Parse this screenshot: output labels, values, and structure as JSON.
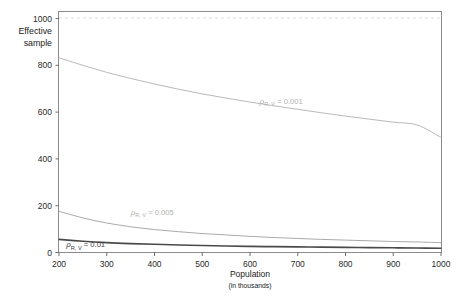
{
  "chart_data": {
    "type": "line",
    "title": "",
    "xlabel": "Population",
    "xlabel_sub": "(in thousands)",
    "ylabel_line1": "Effective",
    "ylabel_line2": "sample",
    "xlim": [
      200,
      1000
    ],
    "ylim": [
      0,
      1030
    ],
    "xticks": [
      200,
      300,
      400,
      500,
      600,
      700,
      800,
      900,
      1000
    ],
    "yticks": [
      0,
      200,
      400,
      600,
      800,
      1000
    ],
    "grid": false,
    "legend_position": "inline-annotations",
    "reference_line": {
      "label": "1000",
      "value": 1000,
      "style": "dashed",
      "color": "#d8d8d8"
    },
    "x": [
      200,
      250,
      300,
      350,
      400,
      450,
      500,
      550,
      600,
      650,
      700,
      750,
      800,
      850,
      900,
      950,
      1000
    ],
    "series": [
      {
        "name": "rho_RV_0001",
        "label_rho": "ρ",
        "label_sub": "R, V",
        "label_eq": " = 0.001",
        "color": "#b9b9b9",
        "width": 1.0,
        "values": [
          832,
          800,
          770,
          744,
          720,
          698,
          678,
          660,
          643,
          627,
          612,
          597,
          583,
          570,
          557,
          545,
          492
        ]
      },
      {
        "name": "rho_RV_0005",
        "label_rho": "ρ",
        "label_sub": "R, V",
        "label_eq": " = 0.005",
        "color": "#aaaaaa",
        "width": 1.0,
        "values": [
          176,
          148,
          126,
          110,
          98,
          89,
          81,
          75,
          69,
          64,
          60,
          56,
          53,
          50,
          47,
          45,
          42
        ]
      },
      {
        "name": "rho_RV_001",
        "label_rho": "ρ",
        "label_sub": "R, V",
        "label_eq": " = 0.01",
        "color": "#4a4a4a",
        "width": 1.6,
        "values": [
          56,
          48,
          42,
          38,
          35,
          32,
          30,
          28,
          26,
          25,
          24,
          23,
          22,
          21,
          20,
          19,
          18
        ]
      }
    ],
    "annotations": [
      {
        "name": "label-series-0001",
        "x": 620,
        "y": 636,
        "anchor": "start"
      },
      {
        "name": "label-series-0005",
        "x": 350,
        "y": 160,
        "anchor": "start"
      },
      {
        "name": "label-series-001",
        "x": 215,
        "y": 22,
        "anchor": "start"
      }
    ]
  }
}
